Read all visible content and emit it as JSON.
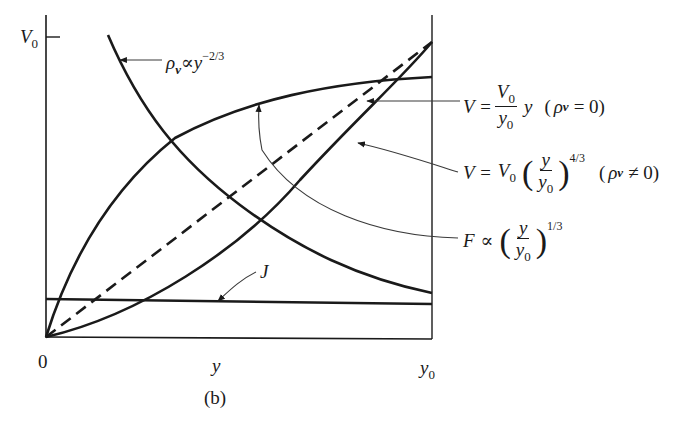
{
  "figure": {
    "caption": "(b)",
    "axes": {
      "origin_label": "0",
      "y_axis_tick_label": "V",
      "y_axis_tick_sub": "0",
      "x_axis_mid_label": "y",
      "x_axis_end_label": "y",
      "x_axis_end_sub": "0"
    },
    "curves": [
      {
        "id": "space-charge-density",
        "label_parts": {
          "symbol": "ρ",
          "symbol_sub": "v",
          "relation": "∝",
          "var": "y",
          "exponent": "−2/3"
        },
        "style": "solid",
        "shape": "decreasing hyperbola-like"
      },
      {
        "id": "linear-potential",
        "label_parts": {
          "lhs": "V =",
          "num": "V",
          "num_sub": "0",
          "den": "y",
          "den_sub": "0",
          "var": "y",
          "cond_open": "(",
          "cond_symbol": "ρ",
          "cond_sub": "v",
          "cond_rel": "= 0)"
        },
        "style": "dashed",
        "shape": "linear from origin to (y0, V0)"
      },
      {
        "id": "space-charge-potential",
        "label_parts": {
          "lhs": "V =",
          "coef": "V",
          "coef_sub": "0",
          "num": "y",
          "den": "y",
          "den_sub": "0",
          "exponent": "4/3",
          "cond_open": "(",
          "cond_symbol": "ρ",
          "cond_sub": "v",
          "cond_rel": "≠ 0)"
        },
        "style": "solid",
        "shape": "convex rising to (y0, V0)"
      },
      {
        "id": "electric-field",
        "label_parts": {
          "lhs": "F",
          "relation": "∝",
          "num": "y",
          "den": "y",
          "den_sub": "0",
          "exponent": "1/3"
        },
        "style": "solid",
        "shape": "concave rising"
      },
      {
        "id": "current-density",
        "label_parts": {
          "symbol": "J"
        },
        "style": "solid",
        "shape": "constant horizontal"
      }
    ],
    "colors": {
      "ink": "#1a1a1a",
      "leader": "#3a3a3a",
      "background": "#ffffff"
    }
  }
}
